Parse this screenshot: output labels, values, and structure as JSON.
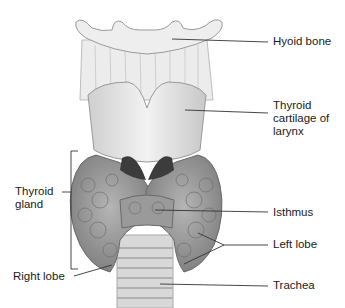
{
  "diagram": {
    "colors": {
      "background": "#ffffff",
      "text": "#1a1a1a",
      "line": "#333333",
      "cartilage": "#e4e4e4",
      "gland": "#9a9a9a"
    },
    "labels": {
      "hyoid_bone": "Hyoid bone",
      "thyroid_cartilage": [
        "Thyroid",
        "cartilage of",
        "larynx"
      ],
      "thyroid_gland": [
        "Thyroid",
        "gland"
      ],
      "isthmus": "Isthmus",
      "left_lobe": "Left lobe",
      "right_lobe": "Right lobe",
      "trachea": "Trachea"
    }
  }
}
